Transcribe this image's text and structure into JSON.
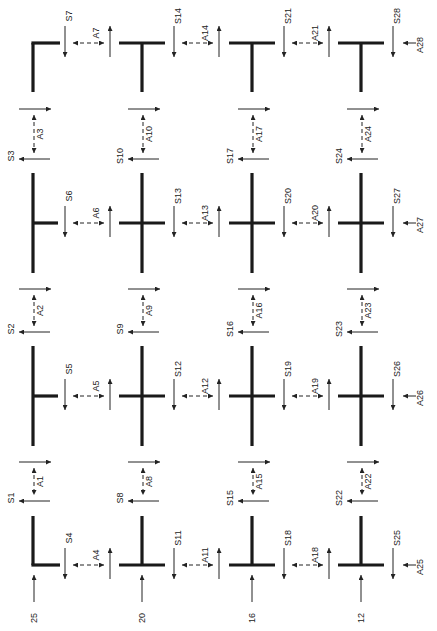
{
  "diagram": {
    "type": "structural-grid-with-force-labels",
    "columns_x": [
      33,
      142,
      252,
      361
    ],
    "rows_y": [
      43,
      223,
      396,
      565
    ],
    "colors": {
      "line": "#1a1a1a",
      "text": "#222222",
      "background": "#ffffff"
    },
    "joints": [
      {
        "id": "j-r1-c1",
        "shape": "corner-top-left",
        "row": 0,
        "col": 0
      },
      {
        "id": "j-r1-c2",
        "shape": "tee-down",
        "row": 0,
        "col": 1
      },
      {
        "id": "j-r1-c3",
        "shape": "tee-down",
        "row": 0,
        "col": 2
      },
      {
        "id": "j-r1-c4",
        "shape": "tee-down",
        "row": 0,
        "col": 3
      },
      {
        "id": "j-r2-c1",
        "shape": "tee-right",
        "row": 1,
        "col": 0
      },
      {
        "id": "j-r2-c2",
        "shape": "cross",
        "row": 1,
        "col": 1
      },
      {
        "id": "j-r2-c3",
        "shape": "cross",
        "row": 1,
        "col": 2
      },
      {
        "id": "j-r2-c4",
        "shape": "cross",
        "row": 1,
        "col": 3
      },
      {
        "id": "j-r3-c1",
        "shape": "tee-right",
        "row": 2,
        "col": 0
      },
      {
        "id": "j-r3-c2",
        "shape": "cross",
        "row": 2,
        "col": 1
      },
      {
        "id": "j-r3-c3",
        "shape": "cross",
        "row": 2,
        "col": 2
      },
      {
        "id": "j-r3-c4",
        "shape": "cross",
        "row": 2,
        "col": 3
      },
      {
        "id": "j-r4-c1",
        "shape": "corner-bottom-left",
        "row": 3,
        "col": 0
      },
      {
        "id": "j-r4-c2",
        "shape": "tee-up",
        "row": 3,
        "col": 1
      },
      {
        "id": "j-r4-c3",
        "shape": "tee-up",
        "row": 3,
        "col": 2
      },
      {
        "id": "j-r4-c4",
        "shape": "tee-up",
        "row": 3,
        "col": 3
      }
    ],
    "horizontal_gaps": [
      {
        "row": 0,
        "col": 0,
        "s_label": "S7",
        "a_label": "A7"
      },
      {
        "row": 0,
        "col": 1,
        "s_label": "S14",
        "a_label": "A14"
      },
      {
        "row": 0,
        "col": 2,
        "s_label": "S21",
        "a_label": "A21"
      },
      {
        "row": 0,
        "col": 3,
        "s_label": "S28",
        "a_label": "A28",
        "edge": true
      },
      {
        "row": 1,
        "col": 0,
        "s_label": "S6",
        "a_label": "A6"
      },
      {
        "row": 1,
        "col": 1,
        "s_label": "S13",
        "a_label": "A13"
      },
      {
        "row": 1,
        "col": 2,
        "s_label": "S20",
        "a_label": "A20"
      },
      {
        "row": 1,
        "col": 3,
        "s_label": "S27",
        "a_label": "A27",
        "edge": true
      },
      {
        "row": 2,
        "col": 0,
        "s_label": "S5",
        "a_label": "A5"
      },
      {
        "row": 2,
        "col": 1,
        "s_label": "S12",
        "a_label": "A12"
      },
      {
        "row": 2,
        "col": 2,
        "s_label": "S19",
        "a_label": "A19"
      },
      {
        "row": 2,
        "col": 3,
        "s_label": "S26",
        "a_label": "A26",
        "edge": true
      },
      {
        "row": 3,
        "col": 0,
        "s_label": "S4",
        "a_label": "A4"
      },
      {
        "row": 3,
        "col": 1,
        "s_label": "S11",
        "a_label": "A11"
      },
      {
        "row": 3,
        "col": 2,
        "s_label": "S18",
        "a_label": "A18"
      },
      {
        "row": 3,
        "col": 3,
        "s_label": "S25",
        "a_label": "A25",
        "edge": true
      }
    ],
    "vertical_gaps": [
      {
        "col": 0,
        "row": 0,
        "s_label": "S3",
        "a_label": "A3"
      },
      {
        "col": 1,
        "row": 0,
        "s_label": "S10",
        "a_label": "A10"
      },
      {
        "col": 2,
        "row": 0,
        "s_label": "S17",
        "a_label": "A17"
      },
      {
        "col": 3,
        "row": 0,
        "s_label": "S24",
        "a_label": "A24"
      },
      {
        "col": 0,
        "row": 1,
        "s_label": "S2",
        "a_label": "A2"
      },
      {
        "col": 1,
        "row": 1,
        "s_label": "S9",
        "a_label": "A9"
      },
      {
        "col": 2,
        "row": 1,
        "s_label": "S16",
        "a_label": "A16"
      },
      {
        "col": 3,
        "row": 1,
        "s_label": "S23",
        "a_label": "A23"
      },
      {
        "col": 0,
        "row": 2,
        "s_label": "S1",
        "a_label": "A1"
      },
      {
        "col": 1,
        "row": 2,
        "s_label": "S8",
        "a_label": "A8"
      },
      {
        "col": 2,
        "row": 2,
        "s_label": "S15",
        "a_label": "A15"
      },
      {
        "col": 3,
        "row": 2,
        "s_label": "S22",
        "a_label": "A22"
      }
    ],
    "bottom_loads": [
      {
        "col": 0,
        "label": "25"
      },
      {
        "col": 1,
        "label": "20"
      },
      {
        "col": 2,
        "label": "16"
      },
      {
        "col": 3,
        "label": "12"
      }
    ]
  }
}
